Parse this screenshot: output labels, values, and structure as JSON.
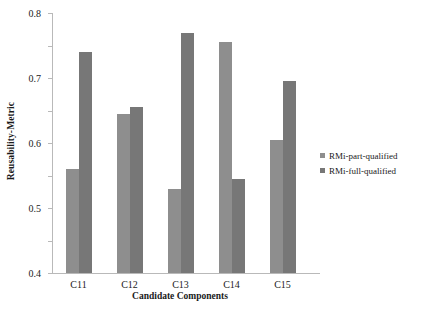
{
  "chart_data": {
    "type": "bar",
    "title": "",
    "xlabel": "Candidate Components",
    "ylabel": "Reusability-Metric",
    "categories": [
      "C11",
      "C12",
      "C13",
      "C14",
      "C15"
    ],
    "series": [
      {
        "name": "RMi-part-qualified",
        "color": "#8e8e8e",
        "values": [
          0.32,
          0.49,
          0.26,
          0.71,
          0.41
        ]
      },
      {
        "name": "RMi-full-qualified",
        "color": "#777777",
        "values": [
          0.68,
          0.51,
          0.74,
          0.29,
          0.59
        ]
      }
    ],
    "ylim": [
      0,
      0.8
    ],
    "ytick_labels": [
      "0.8",
      "0.7",
      "0.6",
      "0.5",
      "0.4",
      "0.3",
      "0.2",
      "0.1",
      "0"
    ],
    "ytick_values": [
      0.8,
      0.7,
      0.6,
      0.5,
      0.4,
      0.3,
      0.2,
      0.1,
      0
    ],
    "grid": false,
    "legend_position": "right"
  }
}
